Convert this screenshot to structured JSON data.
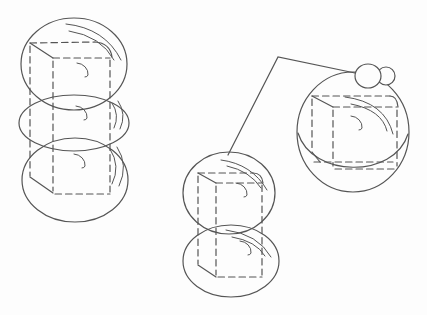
{
  "canvas": {
    "width": 427,
    "height": 315,
    "background": "#fdfdfd",
    "stroke": "#555555",
    "stroke_width": 1.2,
    "detail_stroke_width": 1.0,
    "dash_pattern": "6.5 4"
  },
  "callout": {
    "name": "callout-line",
    "path": "M228,155 L278,57 L355,73"
  },
  "figures": [
    {
      "name": "left-sphere-stack",
      "balls": [
        {
          "cx": 74,
          "cy": 64,
          "rx": 53,
          "ry": 46
        },
        {
          "cx": 74,
          "cy": 123,
          "rx": 55,
          "ry": 28
        },
        {
          "cx": 75,
          "cy": 180,
          "rx": 53,
          "ry": 42
        }
      ],
      "hidden_box_edges": [
        "M30,43 L95,42",
        "M53,58 L110,58",
        "M30,46 L30,176",
        "M53,61 L53,191",
        "M110,60 L110,192",
        "M55,194 L110,194"
      ],
      "visible_box_edges": [
        "M30,43 L53,58",
        "M95,42 Q110,43 112,57",
        "M30,177 L53,193"
      ],
      "shading_arcs": [
        "M66,24 Q105,28 121,60",
        "M69,31 Q101,36 114,60",
        "M77,63 a12,11 0 0 1 11,12 a3,3 0 0 1 -3,2",
        "M112,103 Q120,115 114,128",
        "M118,101 Q127,114 120,129",
        "M76,106 a12,11 0 0 1 11,12 a3,3 0 0 1 -3,2",
        "M110,149 Q121,166 112,184",
        "M117,147 Q129,165 119,186",
        "M74,154 a12,11 0 0 1 11,12 a3,3 0 0 1 -3,2"
      ]
    },
    {
      "name": "middle-sphere-stack",
      "balls": [
        {
          "cx": 229,
          "cy": 193,
          "rx": 46,
          "ry": 41
        },
        {
          "cx": 231,
          "cy": 261,
          "rx": 48,
          "ry": 36
        }
      ],
      "hidden_box_edges": [
        "M198,173 L253,173",
        "M216,183 L262,183",
        "M198,176 L198,264",
        "M216,186 L216,275",
        "M262,185 L262,275",
        "M218,277 L262,277"
      ],
      "visible_box_edges": [
        "M198,173 L216,183",
        "M253,173 Q262,173 263,183",
        "M198,265 L216,277"
      ],
      "shading_arcs": [
        "M221,160 Q252,164 267,190",
        "M227,166 Q250,171 261,188",
        "M236,183 a12,11 0 0 1 11,12 a3,3 0 0 1 -3,2",
        "M226,230 Q258,234 271,257",
        "M232,237 Q256,241 265,256",
        "M240,241 a12,11 0 0 1 11,12 a3,3 0 0 1 -3,2"
      ]
    },
    {
      "name": "right-merged-sphere",
      "balls": [
        {
          "cx": 353,
          "cy": 132,
          "rx": 56,
          "ry": 60
        }
      ],
      "seam_path": "M298,133 C312,178 394,179 408,134",
      "bump_circles": [
        {
          "cx": 386,
          "cy": 76,
          "rx": 9,
          "ry": 9
        },
        {
          "cx": 368,
          "cy": 76,
          "rx": 13,
          "ry": 12
        }
      ],
      "hidden_box_edges": [
        "M312,96 L390,96",
        "M333,107 L397,107",
        "M312,99 L312,151",
        "M333,110 L333,166",
        "M397,110 L397,166",
        "M314,162 L393,162",
        "M335,169 L398,169"
      ],
      "visible_box_edges": [
        "M312,96 L333,107",
        "M390,96 Q397,96 398,107",
        "M312,152 L320,162"
      ],
      "shading_arcs": [
        "M345,97 Q385,102 393,134",
        "M351,104 Q382,110 387,131",
        "M351,116 a12,11 0 0 1 11,12 a3,3 0 0 1 -3,2"
      ]
    }
  ]
}
